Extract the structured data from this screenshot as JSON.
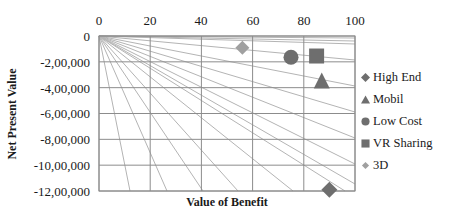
{
  "chart_data": {
    "type": "scatter",
    "title": "",
    "xlabel": "Value of Benefit",
    "ylabel": "Net Present Value",
    "xlim": [
      0,
      100
    ],
    "ylim": [
      -1200000,
      0
    ],
    "x_axis_position": "top",
    "x_ticks": [
      "0",
      "20",
      "40",
      "60",
      "80",
      "100"
    ],
    "y_ticks": [
      "0",
      "-2,00,000",
      "-4,00,000",
      "-6,00,000",
      "-8,00,000",
      "-10,00,000",
      "-12,00,000"
    ],
    "grid": true,
    "background_fan_lines": true,
    "legend_position": "right",
    "series": [
      {
        "name": "High End",
        "marker": "diamond",
        "color": "#6e6e6e",
        "x": 90,
        "y": -1190000
      },
      {
        "name": "Mobil",
        "marker": "triangle",
        "color": "#6e6e6e",
        "x": 87,
        "y": -360000
      },
      {
        "name": "Low Cost",
        "marker": "circle",
        "color": "#6e6e6e",
        "x": 75,
        "y": -165000
      },
      {
        "name": "VR Sharing",
        "marker": "square",
        "color": "#6e6e6e",
        "x": 85,
        "y": -155000
      },
      {
        "name": "3D",
        "marker": "diamond",
        "color": "#a0a0a0",
        "x": 56,
        "y": -90000
      }
    ]
  },
  "legend": {
    "items": [
      {
        "label": "High End",
        "color": "#6e6e6e"
      },
      {
        "label": "Mobil",
        "color": "#6e6e6e"
      },
      {
        "label": "Low Cost",
        "color": "#6e6e6e"
      },
      {
        "label": "VR Sharing",
        "color": "#6e6e6e"
      },
      {
        "label": "3D",
        "color": "#a0a0a0"
      }
    ]
  },
  "colors": {
    "grid": "#8c8c8c",
    "fan": "#b4b4b4",
    "marker_dark": "#6e6e6e",
    "marker_light": "#a0a0a0"
  }
}
